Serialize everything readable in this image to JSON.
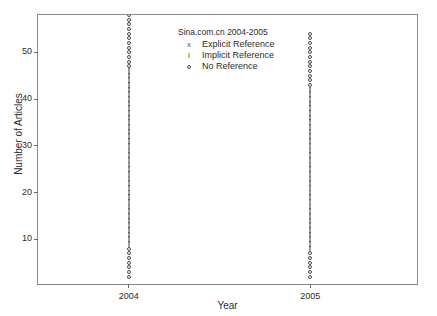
{
  "chart_data": {
    "type": "scatter",
    "title": "",
    "xlabel": "Year",
    "ylabel": "Number of Articles",
    "xlim": [
      2003.5,
      2005.6
    ],
    "ylim": [
      0,
      58
    ],
    "grid": false,
    "legend_position": "top-center",
    "legend_title": "Sina.com.cn 2004-2005",
    "xticks": [
      "2004",
      "2005"
    ],
    "xtick_values": [
      2004,
      2005
    ],
    "yticks": [
      "10",
      "20",
      "30",
      "40",
      "50"
    ],
    "ytick_values": [
      10,
      20,
      30,
      40,
      50
    ],
    "series": [
      {
        "name": "Explicit Reference",
        "marker": "x",
        "categories": [
          "2004",
          "2005"
        ],
        "values": [
          0,
          0
        ]
      },
      {
        "name": "Implicit Reference",
        "marker": "I",
        "categories": [
          "2004",
          "2005"
        ],
        "values": [
          48,
          44
        ],
        "ranges": [
          [
            9,
            56
          ],
          [
            9,
            52
          ]
        ]
      },
      {
        "name": "No Reference",
        "marker": "o",
        "categories": [
          "2004",
          "2005"
        ],
        "values": [
          10,
          8
        ],
        "ranges": [
          [
            2,
            8
          ],
          [
            2,
            7
          ]
        ]
      }
    ],
    "columns": [
      {
        "category": "2004",
        "x_value": 2004,
        "min": 2,
        "max": 58,
        "points": [
          {
            "y": 2,
            "marker": "o"
          },
          {
            "y": 3,
            "marker": "o"
          },
          {
            "y": 4,
            "marker": "o"
          },
          {
            "y": 5,
            "marker": "o"
          },
          {
            "y": 6,
            "marker": "o"
          },
          {
            "y": 7,
            "marker": "o"
          },
          {
            "y": 8,
            "marker": "o"
          },
          {
            "y": 9,
            "marker": "I"
          },
          {
            "y": 10,
            "marker": "I"
          },
          {
            "y": 11,
            "marker": "I"
          },
          {
            "y": 12,
            "marker": "I"
          },
          {
            "y": 13,
            "marker": "I"
          },
          {
            "y": 14,
            "marker": "I"
          },
          {
            "y": 15,
            "marker": "I"
          },
          {
            "y": 16,
            "marker": "I"
          },
          {
            "y": 17,
            "marker": "I"
          },
          {
            "y": 18,
            "marker": "I"
          },
          {
            "y": 19,
            "marker": "I"
          },
          {
            "y": 20,
            "marker": "I"
          },
          {
            "y": 21,
            "marker": "I"
          },
          {
            "y": 22,
            "marker": "I"
          },
          {
            "y": 23,
            "marker": "I"
          },
          {
            "y": 24,
            "marker": "I"
          },
          {
            "y": 25,
            "marker": "I"
          },
          {
            "y": 26,
            "marker": "I"
          },
          {
            "y": 27,
            "marker": "I"
          },
          {
            "y": 28,
            "marker": "I"
          },
          {
            "y": 29,
            "marker": "I"
          },
          {
            "y": 30,
            "marker": "I"
          },
          {
            "y": 31,
            "marker": "I"
          },
          {
            "y": 32,
            "marker": "I"
          },
          {
            "y": 33,
            "marker": "I"
          },
          {
            "y": 34,
            "marker": "I"
          },
          {
            "y": 35,
            "marker": "I"
          },
          {
            "y": 36,
            "marker": "I"
          },
          {
            "y": 37,
            "marker": "I"
          },
          {
            "y": 38,
            "marker": "I"
          },
          {
            "y": 39,
            "marker": "I"
          },
          {
            "y": 40,
            "marker": "I"
          },
          {
            "y": 41,
            "marker": "I"
          },
          {
            "y": 42,
            "marker": "I"
          },
          {
            "y": 43,
            "marker": "I"
          },
          {
            "y": 44,
            "marker": "I"
          },
          {
            "y": 45,
            "marker": "I"
          },
          {
            "y": 46,
            "marker": "I"
          },
          {
            "y": 47,
            "marker": "o"
          },
          {
            "y": 48,
            "marker": "o"
          },
          {
            "y": 49,
            "marker": "o"
          },
          {
            "y": 50,
            "marker": "o"
          },
          {
            "y": 51,
            "marker": "o"
          },
          {
            "y": 52,
            "marker": "o"
          },
          {
            "y": 53,
            "marker": "o"
          },
          {
            "y": 54,
            "marker": "o"
          },
          {
            "y": 55,
            "marker": "o"
          },
          {
            "y": 56,
            "marker": "o"
          },
          {
            "y": 57,
            "marker": "o"
          },
          {
            "y": 58,
            "marker": "o"
          }
        ]
      },
      {
        "category": "2005",
        "x_value": 2005,
        "min": 2,
        "max": 54,
        "points": [
          {
            "y": 2,
            "marker": "o"
          },
          {
            "y": 3,
            "marker": "o"
          },
          {
            "y": 4,
            "marker": "o"
          },
          {
            "y": 5,
            "marker": "o"
          },
          {
            "y": 6,
            "marker": "o"
          },
          {
            "y": 7,
            "marker": "o"
          },
          {
            "y": 8,
            "marker": "I"
          },
          {
            "y": 9,
            "marker": "I"
          },
          {
            "y": 10,
            "marker": "I"
          },
          {
            "y": 11,
            "marker": "I"
          },
          {
            "y": 12,
            "marker": "I"
          },
          {
            "y": 13,
            "marker": "I"
          },
          {
            "y": 14,
            "marker": "I"
          },
          {
            "y": 15,
            "marker": "I"
          },
          {
            "y": 16,
            "marker": "I"
          },
          {
            "y": 17,
            "marker": "I"
          },
          {
            "y": 18,
            "marker": "I"
          },
          {
            "y": 19,
            "marker": "I"
          },
          {
            "y": 20,
            "marker": "I"
          },
          {
            "y": 21,
            "marker": "I"
          },
          {
            "y": 22,
            "marker": "I"
          },
          {
            "y": 23,
            "marker": "I"
          },
          {
            "y": 24,
            "marker": "I"
          },
          {
            "y": 25,
            "marker": "I"
          },
          {
            "y": 26,
            "marker": "I"
          },
          {
            "y": 27,
            "marker": "I"
          },
          {
            "y": 28,
            "marker": "I"
          },
          {
            "y": 29,
            "marker": "I"
          },
          {
            "y": 30,
            "marker": "I"
          },
          {
            "y": 31,
            "marker": "I"
          },
          {
            "y": 32,
            "marker": "I"
          },
          {
            "y": 33,
            "marker": "I"
          },
          {
            "y": 34,
            "marker": "I"
          },
          {
            "y": 35,
            "marker": "I"
          },
          {
            "y": 36,
            "marker": "I"
          },
          {
            "y": 37,
            "marker": "I"
          },
          {
            "y": 38,
            "marker": "I"
          },
          {
            "y": 39,
            "marker": "I"
          },
          {
            "y": 40,
            "marker": "I"
          },
          {
            "y": 41,
            "marker": "I"
          },
          {
            "y": 42,
            "marker": "I"
          },
          {
            "y": 43,
            "marker": "o"
          },
          {
            "y": 44,
            "marker": "o"
          },
          {
            "y": 45,
            "marker": "o"
          },
          {
            "y": 46,
            "marker": "o"
          },
          {
            "y": 47,
            "marker": "o"
          },
          {
            "y": 48,
            "marker": "o"
          },
          {
            "y": 49,
            "marker": "o"
          },
          {
            "y": 50,
            "marker": "o"
          },
          {
            "y": 51,
            "marker": "o"
          },
          {
            "y": 52,
            "marker": "o"
          },
          {
            "y": 53,
            "marker": "o"
          },
          {
            "y": 54,
            "marker": "o"
          }
        ]
      }
    ],
    "legend": [
      {
        "marker": "x",
        "label": "Explicit Reference"
      },
      {
        "marker": "I",
        "label": "Implicit Reference"
      },
      {
        "marker": "o",
        "label": "No Reference"
      }
    ]
  },
  "colors": {
    "frame": "#8a8a8a",
    "marker": "#3f3f3f",
    "text": "#2b2b2b",
    "background": "#ffffff"
  }
}
